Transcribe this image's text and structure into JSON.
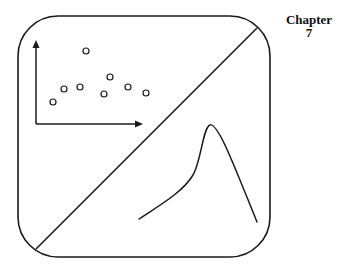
{
  "chapter": {
    "word": "Chapter",
    "number": "7"
  },
  "colors": {
    "stroke": "#1a1a1a",
    "background": "#ffffff"
  },
  "frame": {
    "x": 18,
    "y": 16,
    "width": 252,
    "height": 241,
    "radius": 40
  },
  "diagonal": {
    "x1": 257,
    "y1": 28,
    "x2": 36,
    "y2": 249
  },
  "axes": {
    "origin": [
      36,
      124
    ],
    "y_tip": [
      36,
      40
    ],
    "x_tip": [
      143,
      124
    ]
  },
  "scatter_points": [
    {
      "x": 53,
      "y": 102
    },
    {
      "x": 64,
      "y": 89
    },
    {
      "x": 80,
      "y": 87
    },
    {
      "x": 86,
      "y": 51
    },
    {
      "x": 104,
      "y": 94
    },
    {
      "x": 110,
      "y": 77
    },
    {
      "x": 128,
      "y": 87
    },
    {
      "x": 146,
      "y": 93
    }
  ],
  "curve": {
    "path": "M139,219 C160,205 183,192 193,175 C201,162 203,127 210,125 C218,122 235,168 257,222"
  }
}
